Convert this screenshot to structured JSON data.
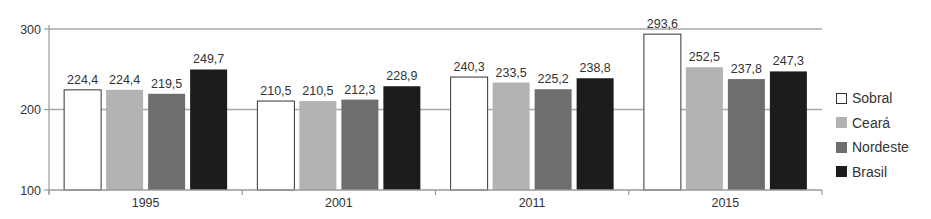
{
  "chart_data": {
    "type": "bar",
    "title": "",
    "xlabel": "",
    "ylabel": "",
    "ylim": [
      100,
      300
    ],
    "yticks": [
      100,
      200,
      300
    ],
    "grid": true,
    "legend_position": "right",
    "categories": [
      "1995",
      "2001",
      "2011",
      "2015"
    ],
    "series": [
      {
        "name": "Sobral",
        "color": "#ffffff",
        "values": [
          224.4,
          210.5,
          240.3,
          293.6
        ],
        "labels": [
          "224,4",
          "210,5",
          "240,3",
          "293,6"
        ]
      },
      {
        "name": "Ceará",
        "color": "#b3b3b3",
        "values": [
          224.4,
          210.5,
          233.5,
          252.5
        ],
        "labels": [
          "224,4",
          "210,5",
          "233,5",
          "252,5"
        ]
      },
      {
        "name": "Nordeste",
        "color": "#6e6e6e",
        "values": [
          219.5,
          212.3,
          225.2,
          237.8
        ],
        "labels": [
          "219,5",
          "212,3",
          "225,2",
          "237,8"
        ]
      },
      {
        "name": "Brasil",
        "color": "#1c1c1c",
        "values": [
          249.7,
          228.9,
          238.8,
          247.3
        ],
        "labels": [
          "249,7",
          "228,9",
          "238,8",
          "247,3"
        ]
      }
    ]
  },
  "legend": {
    "items": [
      {
        "label": "Sobral",
        "color": "#ffffff"
      },
      {
        "label": "Ceará",
        "color": "#b3b3b3"
      },
      {
        "label": "Nordeste",
        "color": "#6e6e6e"
      },
      {
        "label": "Brasil",
        "color": "#1c1c1c"
      }
    ]
  }
}
